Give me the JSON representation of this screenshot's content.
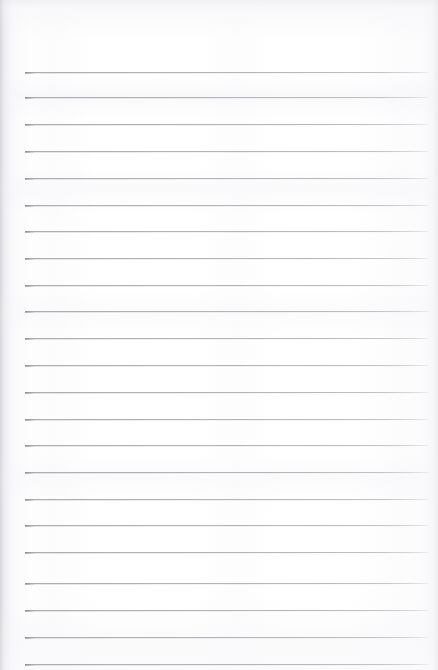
{
  "document": {
    "kind": "scanned-lined-notepad-page",
    "title": "Lined Notepad Page",
    "orientation": "portrait",
    "width_px": 438,
    "height_px": 670,
    "content_text": "",
    "is_blank": "true"
  },
  "paper": {
    "background_color": "#fdfdfd",
    "edge_shade_color": "#e9e9ec",
    "texture": "faint horizontal scan banding with soft vertical streaks"
  },
  "ruling": {
    "line_color": "#b2b2b8",
    "line_cap_color": "#8c8c93",
    "line_thickness_px": 1,
    "line_count": 23,
    "left_margin_px": 25,
    "right_end_px": 428,
    "top_margin_px": 72,
    "line_spacing_px": 26.6,
    "lines_y": [
      72,
      97,
      124,
      151,
      178,
      205,
      231,
      258,
      285,
      311,
      338,
      365,
      392,
      419,
      445,
      472,
      499,
      525,
      552,
      583,
      610,
      637,
      664
    ]
  }
}
